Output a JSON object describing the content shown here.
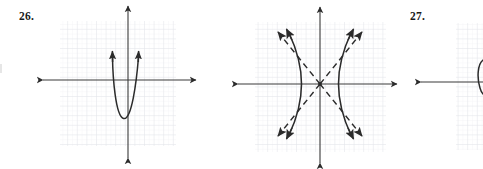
{
  "figure": {
    "kind": "math-textbook-exercise-figures",
    "background_color": "#ffffff",
    "ink_color": "#2b2b2b",
    "grid_major_color": "#e4e4ea",
    "grid_minor_color": "#eff0f4",
    "axis_color": "#3a3a3a"
  },
  "panels": [
    {
      "number": "26.",
      "name": "panel-26",
      "curve_type": "parabola",
      "opens": "up",
      "dashed_asymptotes": false,
      "clipped": false,
      "axes": {
        "x_axis_arrows": "both",
        "y_axis_arrows": "both",
        "origin_px": [
          128,
          80
        ]
      },
      "grid": {
        "left_px": 60,
        "top_px": 21,
        "right_px": 176,
        "bottom_px": 146,
        "major_cell_px": 9.6
      },
      "curve_points": "vertex below x-axis at about (0,-4.5) in grid units, narrow upward parabola, branches end in arrowheads above the x-axis"
    },
    {
      "number": "27.",
      "name": "panel-27",
      "curve_type": "hyperbola",
      "opens": "left-right",
      "dashed_asymptotes": true,
      "clipped": false,
      "axes": {
        "x_axis_arrows": "both",
        "y_axis_arrows": "both",
        "origin_px": [
          320,
          84
        ]
      },
      "grid": {
        "left_px": 255,
        "top_px": 22,
        "right_px": 386,
        "bottom_px": 152,
        "major_cell_px": 9.6
      },
      "curve_points": "two solid branches with vertices at about (-2,0) and (+2,0) in grid units, four dashed asymptote rays of slope about +1 and -1 through the center, arrowheads on all branch ends and asymptote ends"
    },
    {
      "number": "28.",
      "name": "panel-28",
      "curve_type": "unknown-clipped",
      "opens": "",
      "dashed_asymptotes": false,
      "clipped": true,
      "axes": {
        "x_axis_arrows": "left",
        "y_axis_arrows": "none",
        "origin_px": [
          483,
          82
        ]
      },
      "grid": {
        "left_px": 456,
        "top_px": 23,
        "right_px": 483,
        "bottom_px": 150,
        "major_cell_px": 9.6
      },
      "curve_points": "only a small vertical curve fragment is visible at the extreme right edge; the rest of the figure lies outside the screenshot"
    }
  ]
}
